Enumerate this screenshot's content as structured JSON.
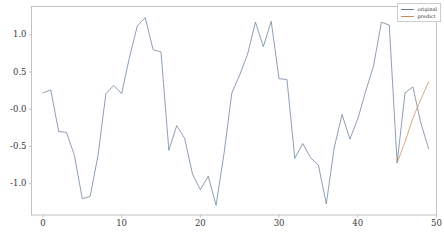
{
  "chart_data": {
    "type": "line",
    "title": "",
    "xlabel": "",
    "ylabel": "",
    "xlim": [
      -1.45,
      50.0
    ],
    "ylim": [
      -1.42,
      1.38
    ],
    "grid": false,
    "legend_position": "upper right",
    "xticks": [
      "0",
      "10",
      "20",
      "30",
      "40",
      "50"
    ],
    "xtick_values": [
      0,
      10,
      20,
      30,
      40,
      50
    ],
    "yticks": [
      "1.0",
      "0.5",
      "-0.0",
      "-0.5",
      "-1.0"
    ],
    "ytick_values": [
      1.0,
      0.5,
      0.0,
      -0.5,
      -1.0
    ],
    "series": [
      {
        "name": "original",
        "color": "#6a7f9c",
        "x": [
          0,
          1,
          2,
          3,
          4,
          5,
          6,
          7,
          8,
          9,
          10,
          11,
          12,
          13,
          14,
          15,
          16,
          17,
          18,
          19,
          20,
          21,
          22,
          23,
          24,
          25,
          26,
          27,
          28,
          29,
          30,
          31,
          32,
          33,
          34,
          35,
          36,
          37,
          38,
          39,
          40,
          41,
          42,
          43,
          44,
          45,
          46,
          47,
          48,
          49
        ],
        "values": [
          0.22,
          0.26,
          -0.3,
          -0.31,
          -0.62,
          -1.2,
          -1.17,
          -0.62,
          0.21,
          0.32,
          0.21,
          0.7,
          1.12,
          1.23,
          0.8,
          0.77,
          -0.55,
          -0.22,
          -0.39,
          -0.87,
          -1.08,
          -0.9,
          -1.29,
          -0.6,
          0.22,
          0.46,
          0.74,
          1.17,
          0.84,
          1.18,
          0.41,
          0.4,
          -0.66,
          -0.46,
          -0.65,
          -0.75,
          -1.27,
          -0.52,
          -0.07,
          -0.4,
          -0.13,
          0.24,
          0.58,
          1.17,
          1.13,
          -0.72,
          0.22,
          0.3,
          -0.18,
          -0.53
        ]
      },
      {
        "name": "predict",
        "color": "#c88a5a",
        "x": [
          45,
          46,
          47,
          48,
          49
        ],
        "values": [
          -0.72,
          -0.44,
          -0.12,
          0.13,
          0.37
        ]
      }
    ]
  },
  "legend": {
    "entries": [
      {
        "label": "original"
      },
      {
        "label": "predict"
      }
    ]
  },
  "axes": {
    "x_tick_labels": [
      "0",
      "10",
      "20",
      "30",
      "40",
      "50"
    ],
    "y_tick_labels": [
      "1.0",
      "0.5",
      "-0.0",
      "-0.5",
      "-1.0"
    ]
  },
  "colors": {
    "series_original": "#6a7f9c",
    "series_predict": "#c88a5a",
    "axis": "#b0b0b0",
    "background": "#ffffff"
  }
}
